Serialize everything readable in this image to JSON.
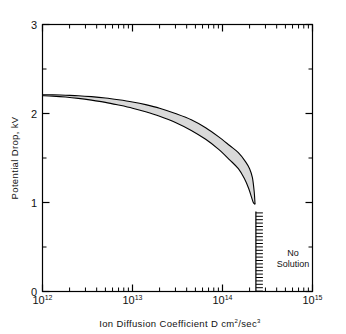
{
  "chart_data": {
    "type": "line",
    "title": "",
    "xlabel": "Ion Diffusion Coefficient D cm²/sec³",
    "xlabel_parts": {
      "text_a": "Ion Diffusion Coefficient D cm",
      "sup_a": "2",
      "text_b": "/sec",
      "sup_b": "3"
    },
    "ylabel": "Potential Drop, kV",
    "xscale": "log",
    "yscale": "linear",
    "xlim": [
      1000000000000.0,
      1000000000000000.0
    ],
    "ylim": [
      0,
      3
    ],
    "grid": false,
    "legend": null,
    "x_tick_labels": [
      "10¹²",
      "10¹³",
      "10¹⁴",
      "10¹⁵"
    ],
    "x_tick_bases": [
      "10",
      "10",
      "10",
      "10"
    ],
    "x_tick_exponents": [
      "12",
      "13",
      "14",
      "15"
    ],
    "x_tick_values": [
      1000000000000.0,
      10000000000000.0,
      100000000000000.0,
      1000000000000000.0
    ],
    "y_tick_labels": [
      "0",
      "1",
      "2",
      "3"
    ],
    "y_tick_values": [
      0,
      1,
      2,
      3
    ],
    "y_minor_ticks": [
      0.5,
      1.5,
      2.5
    ],
    "series": [
      {
        "name": "upper-bound",
        "x": [
          1000000000000.0,
          1300000000000.0,
          1800000000000.0,
          2500000000000.0,
          3500000000000.0,
          5000000000000.0,
          7000000000000.0,
          10000000000000.0,
          14000000000000.0,
          20000000000000.0,
          30000000000000.0,
          45000000000000.0,
          65000000000000.0,
          90000000000000.0,
          120000000000000.0,
          150000000000000.0,
          180000000000000.0,
          200000000000000.0,
          215000000000000.0,
          225000000000000.0,
          230000000000000.0
        ],
        "y": [
          2.21,
          2.21,
          2.205,
          2.2,
          2.19,
          2.175,
          2.155,
          2.13,
          2.1,
          2.06,
          2.0,
          1.93,
          1.84,
          1.74,
          1.64,
          1.56,
          1.46,
          1.38,
          1.28,
          1.12,
          0.98
        ]
      },
      {
        "name": "lower-bound",
        "x": [
          1000000000000.0,
          1300000000000.0,
          1800000000000.0,
          2500000000000.0,
          3500000000000.0,
          5000000000000.0,
          7000000000000.0,
          10000000000000.0,
          14000000000000.0,
          20000000000000.0,
          30000000000000.0,
          45000000000000.0,
          65000000000000.0,
          90000000000000.0,
          120000000000000.0,
          150000000000000.0,
          175000000000000.0,
          195000000000000.0,
          210000000000000.0,
          220000000000000.0,
          230000000000000.0
        ],
        "y": [
          2.2,
          2.195,
          2.185,
          2.17,
          2.15,
          2.125,
          2.095,
          2.06,
          2.02,
          1.97,
          1.9,
          1.81,
          1.71,
          1.6,
          1.48,
          1.38,
          1.27,
          1.16,
          1.06,
          1.0,
          0.98
        ]
      }
    ],
    "band_fill": "#d9d9d9",
    "line_color": "#000000",
    "annotations": [
      {
        "name": "no-solution",
        "line1": "No",
        "line2": "Solution",
        "x_value": 235000000000000.0,
        "y_top": 0.9,
        "y_bottom": 0.0
      }
    ]
  },
  "figure": {
    "axis_color": "#000000",
    "background": "#ffffff"
  }
}
